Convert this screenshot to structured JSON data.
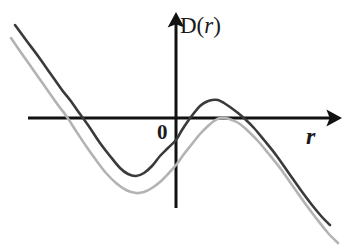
{
  "figure": {
    "kind": "math-plot",
    "background_color": "#ffffff",
    "width": 350,
    "height": 245
  },
  "axes": {
    "x_axis": {
      "name": "horizontal-axis",
      "label": "r",
      "label_style": "bold-italic-serif",
      "color": "#111111",
      "stroke_width": 3,
      "start": [
        28,
        118
      ],
      "end": [
        330,
        118
      ],
      "arrow": "right"
    },
    "y_axis": {
      "name": "vertical-axis",
      "label_prefix": "D(",
      "label_variable": "r",
      "label_suffix": ")",
      "label_full": "D(r)",
      "color": "#111111",
      "stroke_width": 3,
      "start": [
        176,
        208
      ],
      "end": [
        176,
        24
      ],
      "arrow": "up"
    },
    "origin": {
      "label": "0",
      "position": [
        160,
        132
      ]
    }
  },
  "chart_data": {
    "type": "line",
    "title": "",
    "xlabel": "r",
    "ylabel": "D(r)",
    "grid": false,
    "legend": "none",
    "axis_origin_px": [
      176,
      118
    ],
    "xlim_px": [
      10,
      340
    ],
    "ylim_px": [
      20,
      245
    ],
    "series": [
      {
        "name": "dark-curve",
        "color": "#3a3a3a",
        "stroke_width": 2.6,
        "description": "cubic with negative leading coefficient; local max rises above the r-axis",
        "points_px": [
          [
            15,
            25
          ],
          [
            26,
            40
          ],
          [
            38,
            56
          ],
          [
            50,
            73
          ],
          [
            62,
            90
          ],
          [
            70,
            100
          ],
          [
            80,
            114
          ],
          [
            90,
            128
          ],
          [
            100,
            143
          ],
          [
            110,
            156
          ],
          [
            120,
            168
          ],
          [
            128,
            174
          ],
          [
            136,
            176
          ],
          [
            144,
            173
          ],
          [
            152,
            166
          ],
          [
            160,
            156
          ],
          [
            168,
            148
          ],
          [
            176,
            140
          ],
          [
            182,
            130
          ],
          [
            188,
            121
          ],
          [
            194,
            113
          ],
          [
            200,
            106
          ],
          [
            206,
            102
          ],
          [
            212,
            100
          ],
          [
            218,
            100
          ],
          [
            224,
            103
          ],
          [
            230,
            107
          ],
          [
            238,
            113
          ],
          [
            245,
            119
          ],
          [
            254,
            128
          ],
          [
            264,
            140
          ],
          [
            276,
            155
          ],
          [
            288,
            172
          ],
          [
            300,
            189
          ],
          [
            312,
            205
          ],
          [
            322,
            217
          ],
          [
            330,
            225
          ]
        ],
        "x_axis_crossings_px": [
          70,
          190,
          245
        ],
        "local_min_px": [
          134,
          176
        ],
        "local_max_px": [
          215,
          100
        ],
        "y_intercept_px": 140
      },
      {
        "name": "light-gray-curve",
        "color": "#b3b3b3",
        "stroke_width": 2.6,
        "description": "same shape shifted down and right; local max only grazes the r-axis",
        "points_px": [
          [
            11,
            38
          ],
          [
            22,
            54
          ],
          [
            34,
            71
          ],
          [
            46,
            88
          ],
          [
            58,
            105
          ],
          [
            67,
            117
          ],
          [
            76,
            131
          ],
          [
            86,
            146
          ],
          [
            96,
            160
          ],
          [
            106,
            173
          ],
          [
            116,
            183
          ],
          [
            126,
            190
          ],
          [
            136,
            193
          ],
          [
            144,
            192
          ],
          [
            152,
            188
          ],
          [
            160,
            182
          ],
          [
            168,
            174
          ],
          [
            176,
            165
          ],
          [
            184,
            154
          ],
          [
            192,
            144
          ],
          [
            200,
            134
          ],
          [
            208,
            126
          ],
          [
            214,
            121
          ],
          [
            220,
            118
          ],
          [
            226,
            118
          ],
          [
            232,
            120
          ],
          [
            240,
            124
          ],
          [
            248,
            131
          ],
          [
            258,
            141
          ],
          [
            268,
            153
          ],
          [
            280,
            168
          ],
          [
            292,
            185
          ],
          [
            304,
            202
          ],
          [
            316,
            218
          ],
          [
            328,
            233
          ],
          [
            338,
            243
          ]
        ],
        "x_axis_crossings_px": [
          67,
          221
        ],
        "local_min_px": [
          140,
          193
        ],
        "local_max_px": [
          222,
          118
        ],
        "y_intercept_px": 165
      }
    ]
  },
  "colors": {
    "axis": "#111111",
    "dark_curve": "#3a3a3a",
    "light_curve": "#b3b3b3",
    "text": "#1a1a1a",
    "background": "#ffffff"
  }
}
